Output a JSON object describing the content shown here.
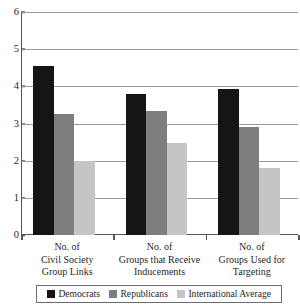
{
  "chart_data": {
    "type": "bar",
    "title": "",
    "subtitle": "",
    "xlabel": "",
    "ylabel": "",
    "ylim": [
      0,
      6
    ],
    "yticks": [
      "0",
      "1",
      "2",
      "3",
      "4",
      "5",
      "6"
    ],
    "grid": "horizontal",
    "legend_position": "bottom",
    "categories": [
      "No. of\nCivil Society\nGroup Links",
      "No. of\nGroups that Receive\nInducements",
      "No. of\nGroups Used for\nTargeting"
    ],
    "category_lines": [
      [
        "No. of",
        "Civil Society",
        "Group Links"
      ],
      [
        "No. of",
        "Groups that Receive",
        "Inducements"
      ],
      [
        "No. of",
        "Groups Used for",
        "Targeting"
      ]
    ],
    "series": [
      {
        "name": "Democrats",
        "color": "#151515",
        "values": [
          4.55,
          3.8,
          3.92
        ]
      },
      {
        "name": "Republicans",
        "color": "#7d7e80",
        "values": [
          3.25,
          3.35,
          2.9
        ]
      },
      {
        "name": "International Average",
        "color": "#c4c5c7",
        "values": [
          2.0,
          2.48,
          1.8
        ]
      }
    ]
  },
  "legend": {
    "items": [
      {
        "label": "Democrats",
        "swatch_class": "democrats"
      },
      {
        "label": "Republicans",
        "swatch_class": "republicans"
      },
      {
        "label": "International Average",
        "swatch_class": "international"
      }
    ]
  }
}
